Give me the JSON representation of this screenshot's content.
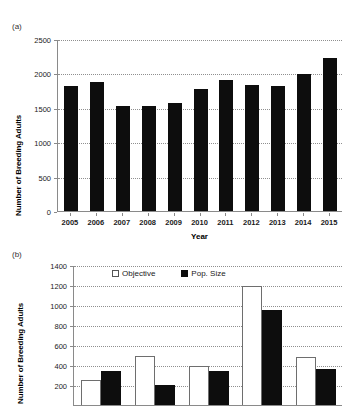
{
  "figure": {
    "panel_a_label": "(a)",
    "panel_b_label": "(b)"
  },
  "chart_data": [
    {
      "id": "panel-a",
      "type": "bar",
      "title": "",
      "xlabel": "Year",
      "ylabel": "Number of Breeding Adults",
      "categories": [
        "2005",
        "2006",
        "2007",
        "2008",
        "2009",
        "2010",
        "2011",
        "2012",
        "2013",
        "2014",
        "2015"
      ],
      "values": [
        1815,
        1870,
        1525,
        1530,
        1570,
        1775,
        1900,
        1835,
        1810,
        1990,
        2230
      ],
      "series_name": "Number of Breeding Adults",
      "bar_color": "#0d0d0d",
      "ylim": [
        0,
        2500
      ],
      "yticks": [
        0,
        500,
        1000,
        1500,
        2000,
        2500
      ],
      "ytick_labels": [
        "0",
        "500",
        "1000",
        "1500",
        "2000",
        "2500"
      ],
      "grid": true,
      "legend": "none"
    },
    {
      "id": "panel-b",
      "type": "bar",
      "title": "",
      "xlabel": "",
      "ylabel": "Number of Breeding Adults",
      "categories": [
        "1",
        "2",
        "3",
        "4",
        "5"
      ],
      "series": [
        {
          "name": "Objective",
          "values": [
            250,
            490,
            395,
            1190,
            485
          ],
          "color": "#ffffff"
        },
        {
          "name": "Pop. Size",
          "values": [
            340,
            200,
            340,
            950,
            365
          ],
          "color": "#0d0d0d"
        }
      ],
      "ylim": [
        0,
        1400
      ],
      "yticks": [
        200,
        400,
        600,
        800,
        1000,
        1200,
        1400
      ],
      "ytick_labels": [
        "200",
        "400",
        "600",
        "800",
        "1000",
        "1200",
        "1400"
      ],
      "grid": true,
      "legend": "top-inside",
      "note": "panel cropped at bottom of image"
    }
  ]
}
